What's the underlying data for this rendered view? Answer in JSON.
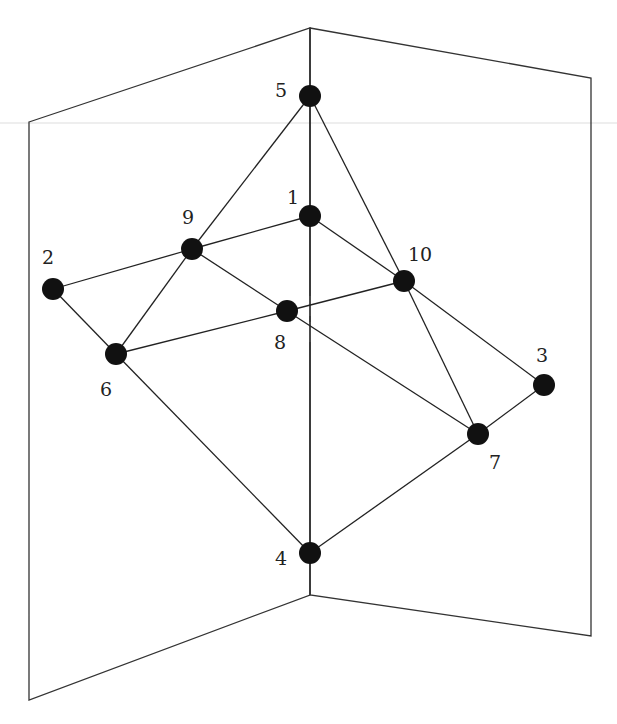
{
  "diagram": {
    "type": "graph-on-two-planes",
    "colors": {
      "edge": "#222222",
      "node": "#111111",
      "frame": "#333333",
      "guide": "#dddddd",
      "background": "#ffffff"
    },
    "frame": {
      "left_panel": [
        [
          29,
          122
        ],
        [
          310,
          28
        ],
        [
          310,
          595
        ],
        [
          29,
          700
        ]
      ],
      "right_panel": [
        [
          310,
          28
        ],
        [
          591,
          78
        ],
        [
          591,
          636
        ],
        [
          310,
          595
        ]
      ],
      "guide_line_y": 123
    },
    "spine": {
      "x": 310,
      "segments": [
        [
          28,
          86
        ],
        [
          106,
          206
        ],
        [
          226,
          296
        ],
        [
          316,
          322
        ],
        [
          342,
          543
        ],
        [
          563,
          595
        ]
      ]
    },
    "nodes": [
      {
        "id": "1",
        "x": 310,
        "y": 216,
        "label": "1",
        "lx": 293,
        "ly": 197
      },
      {
        "id": "2",
        "x": 53,
        "y": 289,
        "label": "2",
        "lx": 48,
        "ly": 257
      },
      {
        "id": "3",
        "x": 544,
        "y": 385,
        "label": "3",
        "lx": 542,
        "ly": 355
      },
      {
        "id": "4",
        "x": 310,
        "y": 553,
        "label": "4",
        "lx": 281,
        "ly": 558
      },
      {
        "id": "5",
        "x": 310,
        "y": 96,
        "label": "5",
        "lx": 281,
        "ly": 90
      },
      {
        "id": "6",
        "x": 116,
        "y": 354,
        "label": "6",
        "lx": 106,
        "ly": 389
      },
      {
        "id": "7",
        "x": 478,
        "y": 434,
        "label": "7",
        "lx": 495,
        "ly": 462
      },
      {
        "id": "8",
        "x": 287,
        "y": 311,
        "label": "8",
        "lx": 280,
        "ly": 342
      },
      {
        "id": "9",
        "x": 192,
        "y": 249,
        "label": "9",
        "lx": 188,
        "ly": 217
      },
      {
        "id": "10",
        "x": 404,
        "y": 281,
        "label": "10",
        "lx": 420,
        "ly": 254
      }
    ],
    "edges": [
      [
        "5",
        "9"
      ],
      [
        "5",
        "10"
      ],
      [
        "1",
        "9"
      ],
      [
        "1",
        "10"
      ],
      [
        "2",
        "9"
      ],
      [
        "2",
        "6"
      ],
      [
        "9",
        "6"
      ],
      [
        "9",
        "8"
      ],
      [
        "6",
        "8"
      ],
      [
        "8",
        "10"
      ],
      [
        "8",
        "7"
      ],
      [
        "10",
        "7"
      ],
      [
        "10",
        "3"
      ],
      [
        "3",
        "7"
      ],
      [
        "6",
        "4"
      ],
      [
        "4",
        "7"
      ]
    ],
    "node_radius": 11
  }
}
